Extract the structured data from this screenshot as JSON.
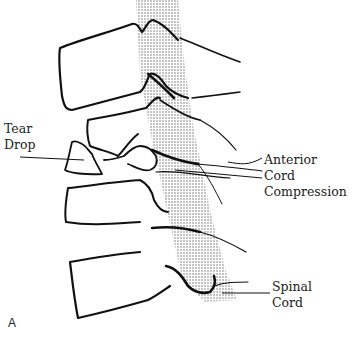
{
  "figure": {
    "panel_letter": "A",
    "labels": {
      "tear_drop": {
        "line1": "Tear",
        "line2": "Drop"
      },
      "anterior_cord_compression": {
        "line1": "Anterior",
        "line2": "Cord",
        "line3": "Compression"
      },
      "spinal_cord": {
        "line1": "Spinal",
        "line2": "Cord"
      }
    },
    "colors": {
      "outline": "#111111",
      "stipple": "#777777",
      "text": "#222222",
      "background": "#ffffff"
    }
  }
}
